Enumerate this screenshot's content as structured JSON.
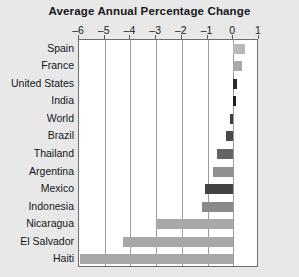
{
  "chart_data": {
    "type": "bar",
    "orientation": "horizontal",
    "title": "Average Annual Percentage Change",
    "xlabel": "",
    "ylabel": "",
    "xlim": [
      -6,
      1
    ],
    "xticks": [
      -6,
      -5,
      -4,
      -3,
      -2,
      -1,
      0,
      1
    ],
    "xtick_labels": [
      "-6",
      "-5",
      "-4",
      "-3",
      "-2",
      "-1",
      "0",
      "1"
    ],
    "grid": true,
    "legend": "none",
    "categories": [
      "Spain",
      "France",
      "United States",
      "India",
      "World",
      "Brazil",
      "Thailand",
      "Argentina",
      "Mexico",
      "Indonesia",
      "Nicaragua",
      "El Salvador",
      "Haiti"
    ],
    "values": [
      0.45,
      0.35,
      0.15,
      0.1,
      -0.12,
      -0.3,
      -0.65,
      -0.8,
      -1.1,
      -1.2,
      -3.0,
      -4.3,
      -5.95
    ],
    "bar_colors": [
      "#b9b9b9",
      "#a9a9a9",
      "#2b2b2b",
      "#1d1d1d",
      "#3d3d3d",
      "#4a4a4a",
      "#646464",
      "#8f8f8f",
      "#434343",
      "#8a8a8a",
      "#a8a8a8",
      "#a8a8a8",
      "#a8a8a8"
    ]
  },
  "style": {
    "page_background": "#e8e8e8",
    "plot_background": "#ffffff",
    "gridline_color": "#9b9b9f",
    "axis_border_color": "#6e6e72",
    "text_color": "#15151a"
  }
}
